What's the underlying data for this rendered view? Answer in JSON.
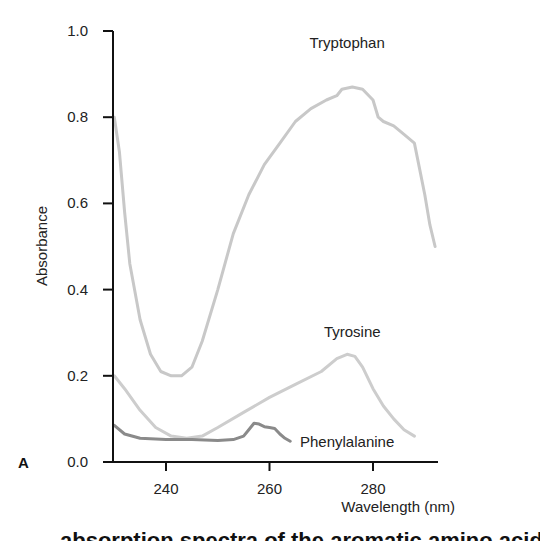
{
  "chart_data": {
    "type": "line",
    "title": "",
    "panel_label": "A",
    "xlabel": "Wavelength (nm)",
    "ylabel": "Absorbance",
    "xlim": [
      230,
      292
    ],
    "ylim": [
      0.0,
      1.0
    ],
    "x_ticks": [
      240,
      260,
      280
    ],
    "y_ticks": [
      0.0,
      0.2,
      0.4,
      0.6,
      0.8,
      1.0
    ],
    "y_tick_labels": [
      "0.0",
      "0.2",
      "0.4",
      "0.6",
      "0.8",
      "1.0"
    ],
    "grid": false,
    "legend": "inline labels",
    "series": [
      {
        "name": "Tryptophan",
        "color": "#c8c8c8",
        "label_pos": [
          275,
          0.96
        ],
        "points": [
          [
            230,
            0.8
          ],
          [
            231,
            0.72
          ],
          [
            232,
            0.58
          ],
          [
            233,
            0.46
          ],
          [
            235,
            0.33
          ],
          [
            237,
            0.25
          ],
          [
            239,
            0.21
          ],
          [
            241,
            0.2
          ],
          [
            243,
            0.2
          ],
          [
            245,
            0.22
          ],
          [
            247,
            0.28
          ],
          [
            250,
            0.4
          ],
          [
            253,
            0.53
          ],
          [
            256,
            0.62
          ],
          [
            259,
            0.69
          ],
          [
            262,
            0.74
          ],
          [
            265,
            0.79
          ],
          [
            268,
            0.82
          ],
          [
            271,
            0.84
          ],
          [
            273,
            0.85
          ],
          [
            274,
            0.865
          ],
          [
            276,
            0.87
          ],
          [
            278,
            0.865
          ],
          [
            280,
            0.84
          ],
          [
            281,
            0.8
          ],
          [
            282,
            0.79
          ],
          [
            284,
            0.78
          ],
          [
            286,
            0.76
          ],
          [
            288,
            0.74
          ],
          [
            289,
            0.68
          ],
          [
            290,
            0.62
          ],
          [
            291,
            0.55
          ],
          [
            292,
            0.5
          ]
        ]
      },
      {
        "name": "Tyrosine",
        "color": "#cdcdcd",
        "label_pos": [
          276,
          0.29
        ],
        "points": [
          [
            230,
            0.2
          ],
          [
            232,
            0.17
          ],
          [
            235,
            0.12
          ],
          [
            238,
            0.08
          ],
          [
            241,
            0.06
          ],
          [
            244,
            0.055
          ],
          [
            247,
            0.06
          ],
          [
            250,
            0.08
          ],
          [
            255,
            0.115
          ],
          [
            260,
            0.15
          ],
          [
            265,
            0.18
          ],
          [
            270,
            0.21
          ],
          [
            273,
            0.24
          ],
          [
            275,
            0.25
          ],
          [
            276.5,
            0.245
          ],
          [
            278,
            0.22
          ],
          [
            280,
            0.17
          ],
          [
            282,
            0.13
          ],
          [
            284,
            0.1
          ],
          [
            286,
            0.075
          ],
          [
            288,
            0.06
          ]
        ]
      },
      {
        "name": "Phenylalanine",
        "color": "#8a8a8a",
        "label_pos": [
          275,
          0.035
        ],
        "points": [
          [
            230,
            0.085
          ],
          [
            232,
            0.065
          ],
          [
            235,
            0.055
          ],
          [
            240,
            0.052
          ],
          [
            245,
            0.052
          ],
          [
            250,
            0.05
          ],
          [
            253,
            0.052
          ],
          [
            255,
            0.06
          ],
          [
            256,
            0.075
          ],
          [
            257,
            0.09
          ],
          [
            258,
            0.088
          ],
          [
            259,
            0.082
          ],
          [
            260,
            0.08
          ],
          [
            261,
            0.078
          ],
          [
            262,
            0.065
          ],
          [
            263,
            0.055
          ],
          [
            264,
            0.048
          ]
        ]
      }
    ]
  },
  "caption_text": "absorption spectra of the aromatic amino acids"
}
